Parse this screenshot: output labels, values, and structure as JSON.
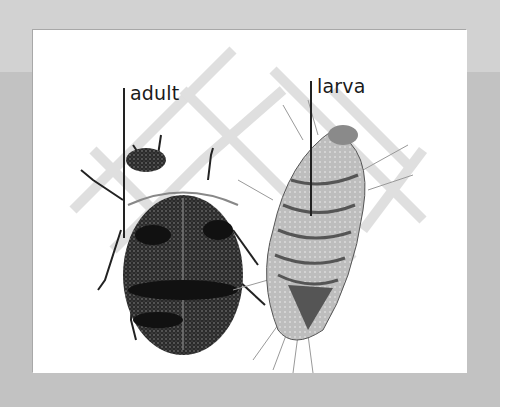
{
  "illustration": {
    "subject": "carpet beetle life stages",
    "labels": {
      "adult": "adult",
      "larva": "larva"
    },
    "colors": {
      "frame_gray": "#c2c2c2",
      "band_gray": "#d2d2d2",
      "panel_white": "#ffffff",
      "ink": "#1a1a1a"
    }
  }
}
